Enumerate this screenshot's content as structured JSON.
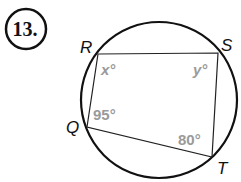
{
  "problem": {
    "number": "13."
  },
  "diagram": {
    "type": "inscribed-quadrilateral",
    "vertices": {
      "R": "R",
      "S": "S",
      "Q": "Q",
      "T": "T"
    },
    "angles": {
      "R": "x°",
      "S": "y°",
      "Q": "95°",
      "T": "80°"
    },
    "colors": {
      "stroke": "#111111",
      "angle_label": "#9a9a9a"
    }
  }
}
